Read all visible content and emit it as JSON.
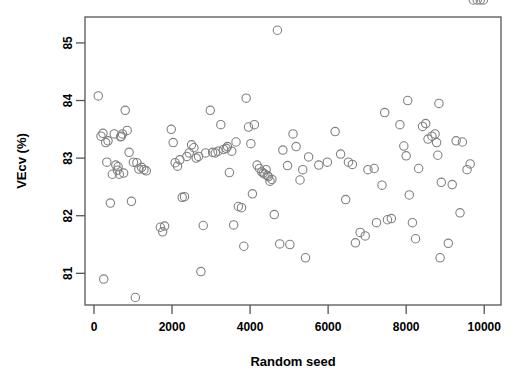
{
  "figure": {
    "background": "#ffffff",
    "point_color": "#808080",
    "axis_color": "#555555",
    "text_color": "#000000"
  },
  "chart_data": {
    "type": "scatter",
    "title": "",
    "xlabel": "Random seed",
    "ylabel": "VEcv (%)",
    "xlim": [
      -230,
      10430
    ],
    "ylim": [
      80.45,
      85.45
    ],
    "xticks": [
      0,
      2000,
      4000,
      6000,
      8000,
      10000
    ],
    "xtick_labels": [
      "0",
      "2000",
      "4000",
      "6000",
      "8000",
      "10000"
    ],
    "yticks": [
      81,
      82,
      83,
      84,
      85
    ],
    "ytick_labels": [
      "81",
      "82",
      "83",
      "84",
      "85"
    ],
    "grid": false,
    "legend": null,
    "marker": "open-circle",
    "marker_size": 4.2,
    "n_points": 130,
    "x": [
      110,
      180,
      230,
      250,
      300,
      330,
      360,
      420,
      470,
      520,
      560,
      600,
      620,
      650,
      680,
      700,
      730,
      760,
      800,
      850,
      900,
      960,
      1010,
      1060,
      1100,
      1150,
      1220,
      1280,
      1340,
      1700,
      1760,
      1810,
      1980,
      2030,
      2080,
      2140,
      2200,
      2260,
      2320,
      2380,
      2440,
      2500,
      2560,
      2620,
      2680,
      2740,
      2800,
      2860,
      2980,
      3040,
      3110,
      3180,
      3250,
      3320,
      3390,
      3420,
      3470,
      3530,
      3580,
      3640,
      3700,
      3780,
      3840,
      3900,
      3960,
      4020,
      4060,
      4110,
      4180,
      4240,
      4300,
      4340,
      4380,
      4410,
      4440,
      4470,
      4510,
      4560,
      4620,
      4700,
      4760,
      4840,
      4960,
      5020,
      5100,
      5180,
      5280,
      5350,
      5420,
      5500,
      5760,
      5980,
      6180,
      6320,
      6450,
      6520,
      6620,
      6700,
      6820,
      6950,
      7020,
      7180,
      7240,
      7380,
      7450,
      7520,
      7620,
      7840,
      7940,
      8000,
      8040,
      8080,
      8160,
      8240,
      8320,
      8420,
      8500,
      8560,
      8660,
      8740,
      8780,
      8810,
      8840,
      8870,
      8900,
      9080,
      9180,
      9280,
      9380,
      9440,
      9560,
      9640,
      9720,
      9820,
      9900,
      9980
    ],
    "y": [
      84.08,
      83.38,
      83.43,
      80.9,
      83.27,
      82.93,
      83.3,
      82.22,
      82.72,
      83.42,
      82.88,
      82.79,
      82.85,
      82.72,
      83.37,
      83.38,
      83.42,
      82.74,
      83.83,
      83.48,
      83.1,
      82.25,
      82.93,
      80.58,
      82.92,
      82.81,
      82.84,
      82.8,
      82.78,
      81.8,
      81.72,
      81.82,
      83.5,
      83.27,
      82.92,
      82.86,
      82.97,
      82.32,
      82.33,
      83.03,
      83.09,
      83.23,
      83.18,
      83.0,
      83.03,
      81.03,
      81.83,
      83.09,
      83.83,
      83.1,
      83.09,
      83.12,
      83.58,
      83.15,
      83.17,
      83.2,
      82.75,
      83.12,
      81.84,
      83.28,
      82.16,
      82.14,
      81.47,
      84.04,
      83.54,
      83.25,
      82.38,
      83.58,
      82.88,
      82.82,
      82.76,
      82.74,
      82.72,
      82.8,
      82.7,
      82.68,
      82.6,
      82.63,
      82.02,
      85.22,
      81.51,
      83.14,
      82.87,
      81.5,
      83.42,
      83.2,
      82.62,
      82.8,
      81.27,
      83.02,
      82.88,
      82.93,
      83.46,
      83.07,
      82.28,
      82.93,
      82.89,
      81.53,
      81.71,
      81.65,
      82.8,
      82.82,
      81.88,
      82.53,
      83.79,
      81.93,
      81.95,
      83.58,
      83.21,
      83.04,
      84.0,
      82.36,
      81.88,
      81.6,
      82.82,
      83.55,
      83.6,
      83.33,
      83.38,
      83.42,
      83.27,
      83.05,
      83.95,
      81.27,
      82.58,
      81.52,
      82.54,
      83.3,
      82.05,
      83.28,
      82.8,
      82.9
    ]
  }
}
